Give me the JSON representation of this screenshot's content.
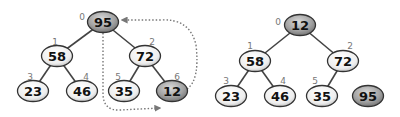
{
  "diagram": {
    "colors": {
      "node_fill_light": "#f4f4f4",
      "node_fill_dark": "#9a9a9a",
      "node_stroke": "#333333",
      "edge": "#444444",
      "index_label": "#777777",
      "swap_arrow": "#777777"
    },
    "left_tree": {
      "name": "before-swap",
      "nodes": [
        {
          "index": "0",
          "value": "95",
          "x": 103,
          "y": 22,
          "highlight": true,
          "ix": 82,
          "iy": 17
        },
        {
          "index": "1",
          "value": "58",
          "x": 57,
          "y": 56,
          "highlight": false,
          "ix": 55,
          "iy": 42
        },
        {
          "index": "2",
          "value": "72",
          "x": 145,
          "y": 56,
          "highlight": false,
          "ix": 152,
          "iy": 42
        },
        {
          "index": "3",
          "value": "23",
          "x": 33,
          "y": 91,
          "highlight": false,
          "ix": 30,
          "iy": 77
        },
        {
          "index": "4",
          "value": "46",
          "x": 82,
          "y": 91,
          "highlight": false,
          "ix": 86,
          "iy": 77
        },
        {
          "index": "5",
          "value": "35",
          "x": 124,
          "y": 91,
          "highlight": false,
          "ix": 118,
          "iy": 77
        },
        {
          "index": "6",
          "value": "12",
          "x": 172,
          "y": 91,
          "highlight": true,
          "ix": 177,
          "iy": 77
        }
      ],
      "edges": [
        [
          0,
          1
        ],
        [
          0,
          2
        ],
        [
          1,
          3
        ],
        [
          1,
          4
        ],
        [
          2,
          5
        ],
        [
          2,
          6
        ]
      ],
      "swap_arrows": [
        {
          "from": "95",
          "to": "12",
          "label": "root moves to last position"
        },
        {
          "from": "12",
          "to": "95",
          "label": "last element moves to root"
        }
      ]
    },
    "right_tree": {
      "name": "after-swap",
      "nodes": [
        {
          "index": "0",
          "value": "12",
          "x": 300,
          "y": 25,
          "highlight": true,
          "ix": 278,
          "iy": 22
        },
        {
          "index": "1",
          "value": "58",
          "x": 255,
          "y": 61,
          "highlight": false,
          "ix": 250,
          "iy": 46
        },
        {
          "index": "2",
          "value": "72",
          "x": 343,
          "y": 61,
          "highlight": false,
          "ix": 350,
          "iy": 46
        },
        {
          "index": "3",
          "value": "23",
          "x": 231,
          "y": 96,
          "highlight": false,
          "ix": 226,
          "iy": 81
        },
        {
          "index": "4",
          "value": "46",
          "x": 280,
          "y": 96,
          "highlight": false,
          "ix": 283,
          "iy": 81
        },
        {
          "index": "5",
          "value": "35",
          "x": 322,
          "y": 96,
          "highlight": false,
          "ix": 315,
          "iy": 81
        },
        {
          "index": "",
          "value": "95",
          "x": 368,
          "y": 96,
          "highlight": true,
          "ix": 0,
          "iy": 0
        }
      ],
      "edges": [
        [
          0,
          1
        ],
        [
          0,
          2
        ],
        [
          1,
          3
        ],
        [
          1,
          4
        ],
        [
          2,
          5
        ]
      ]
    }
  }
}
